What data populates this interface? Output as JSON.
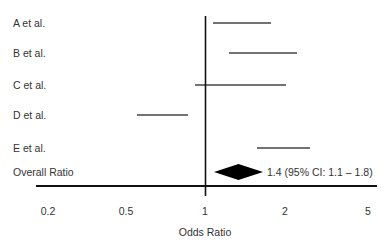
{
  "chart_data": {
    "type": "forest",
    "title": "",
    "xlabel": "Odds Ratio",
    "ylabel": "",
    "x_ticks": [
      {
        "label": "0.2",
        "px": 48
      },
      {
        "label": "0.5",
        "px": 126
      },
      {
        "label": "1",
        "px": 205
      },
      {
        "label": "2",
        "px": 285
      },
      {
        "label": "5",
        "px": 368
      }
    ],
    "reference_line": 1,
    "studies": [
      {
        "name": "A et al.",
        "y": 23,
        "ci_lower": 1.1,
        "ci_upper": 1.9,
        "x1": 213,
        "x2": 271
      },
      {
        "name": "B et al.",
        "y": 53,
        "ci_lower": 1.3,
        "ci_upper": 2.2,
        "x1": 229,
        "x2": 297
      },
      {
        "name": "C et al.",
        "y": 85,
        "ci_lower": 0.95,
        "ci_upper": 2.0,
        "x1": 195,
        "x2": 286
      },
      {
        "name": "D et al.",
        "y": 115,
        "ci_lower": 0.55,
        "ci_upper": 0.85,
        "x1": 137,
        "x2": 188
      },
      {
        "name": "E et al.",
        "y": 148,
        "ci_lower": 1.6,
        "ci_upper": 2.6,
        "x1": 257,
        "x2": 310
      }
    ],
    "overall": {
      "name": "Overall Ratio",
      "estimate": 1.4,
      "ci_lower": 1.1,
      "ci_upper": 1.8,
      "annotation": "1.4 (95% CI: 1.1 – 1.8)",
      "y": 172,
      "x1": 214,
      "x2": 263
    },
    "legend": "none",
    "grid": false
  }
}
